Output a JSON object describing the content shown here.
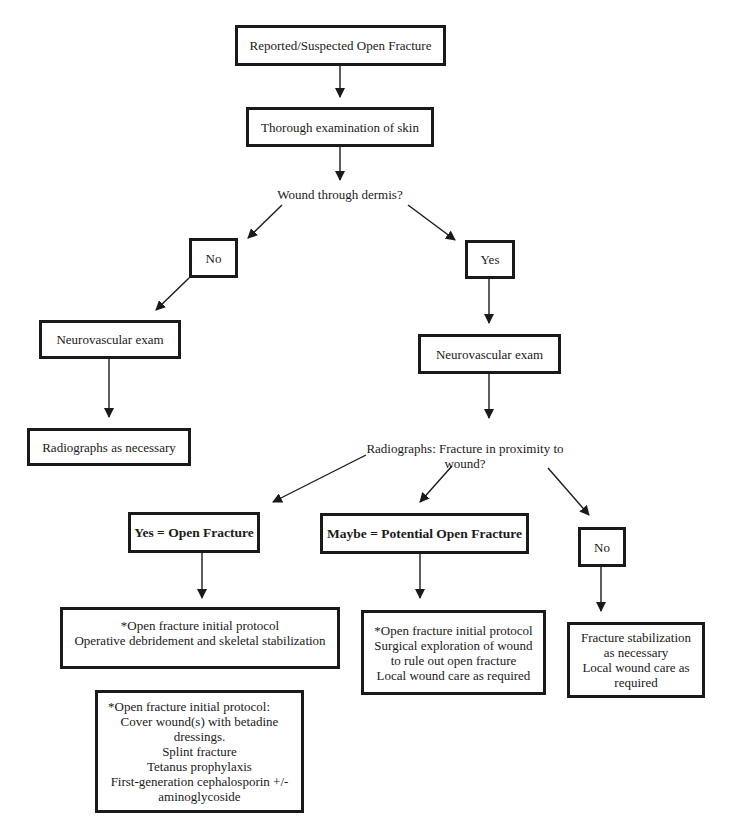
{
  "diagram": {
    "type": "flowchart",
    "nodes": {
      "start": {
        "lines": [
          "Reported/Suspected Open Fracture"
        ]
      },
      "skin_exam": {
        "lines": [
          "Thorough  examination of skin"
        ]
      },
      "decision_dermis": {
        "lines": [
          "Wound through dermis?"
        ]
      },
      "dermis_no": {
        "lines": [
          "No"
        ]
      },
      "dermis_yes": {
        "lines": [
          "Yes"
        ]
      },
      "neuro_left": {
        "lines": [
          "Neurovascular  exam"
        ]
      },
      "neuro_right": {
        "lines": [
          "Neurovascular  exam"
        ]
      },
      "radiographs_necessary": {
        "lines": [
          "Radiographs as necessary"
        ]
      },
      "decision_radiographs": {
        "lines": [
          "Radiographs:  Fracture in proximity to",
          "wound?"
        ]
      },
      "open_fracture": {
        "lines": [
          "Yes = Open Fracture"
        ]
      },
      "potential_open": {
        "lines": [
          "Maybe = Potential Open Fracture"
        ]
      },
      "radiographs_no": {
        "lines": [
          "No"
        ]
      },
      "open_protocol": {
        "lines": [
          "*Open fracture initial protocol",
          "Operative debridement and skeletal stabilization"
        ]
      },
      "potential_protocol": {
        "lines": [
          "*Open fracture initial protocol",
          "Surgical exploration of wound",
          "to rule out open fracture",
          "Local wound care as required"
        ]
      },
      "no_protocol": {
        "lines": [
          "Fracture  stabilization",
          "as  necessary",
          "Local wound care as",
          "required"
        ]
      },
      "footnote": {
        "lines": [
          "*Open fracture initial protocol:",
          "Cover wound(s) with betadine",
          "dressings.",
          "Splint fracture",
          "Tetanus prophylaxis",
          "First-generation cephalosporin +/-",
          "aminoglycoside"
        ]
      }
    },
    "edges": [
      [
        "start",
        "skin_exam"
      ],
      [
        "skin_exam",
        "decision_dermis"
      ],
      [
        "decision_dermis",
        "dermis_no"
      ],
      [
        "decision_dermis",
        "dermis_yes"
      ],
      [
        "dermis_no",
        "neuro_left"
      ],
      [
        "neuro_left",
        "radiographs_necessary"
      ],
      [
        "dermis_yes",
        "neuro_right"
      ],
      [
        "neuro_right",
        "decision_radiographs"
      ],
      [
        "decision_radiographs",
        "open_fracture"
      ],
      [
        "decision_radiographs",
        "potential_open"
      ],
      [
        "decision_radiographs",
        "radiographs_no"
      ],
      [
        "open_fracture",
        "open_protocol"
      ],
      [
        "potential_open",
        "potential_protocol"
      ],
      [
        "radiographs_no",
        "no_protocol"
      ]
    ],
    "colors": {
      "stroke": "#1a1a1a",
      "background": "#ffffff"
    }
  }
}
